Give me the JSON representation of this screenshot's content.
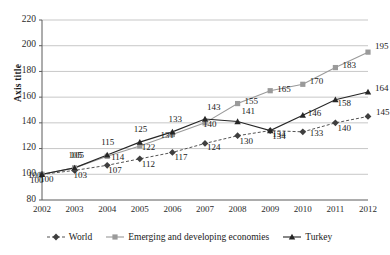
{
  "chart_data": {
    "type": "line",
    "title": "",
    "xlabel": "",
    "ylabel": "Axis title",
    "categories": [
      "2002",
      "2003",
      "2004",
      "2005",
      "2006",
      "2007",
      "2008",
      "2009",
      "2010",
      "2011",
      "2012"
    ],
    "x": [
      2002,
      2003,
      2004,
      2005,
      2006,
      2007,
      2008,
      2009,
      2010,
      2011,
      2012
    ],
    "ylim": [
      80,
      220
    ],
    "ytick_step": 20,
    "yticks": [
      80,
      100,
      120,
      140,
      160,
      180,
      200,
      220
    ],
    "grid": "horizontal",
    "legend_position": "bottom",
    "data_labels": true,
    "series": [
      {
        "name": "World",
        "marker": "diamond",
        "line_style": "dashed",
        "color": "#3f3f3f",
        "values": [
          100,
          103,
          107,
          112,
          117,
          124,
          130,
          134,
          133,
          140,
          145
        ]
      },
      {
        "name": "Emerging and developing economies",
        "marker": "square",
        "line_style": "solid",
        "color": "#9a9a9a",
        "values": [
          100,
          105,
          114,
          122,
          131,
          140,
          155,
          165,
          170,
          183,
          195
        ]
      },
      {
        "name": "Turkey",
        "marker": "triangle",
        "line_style": "solid",
        "color": "#262626",
        "values": [
          100,
          105,
          115,
          125,
          133,
          143,
          141,
          134,
          146,
          158,
          164
        ]
      }
    ]
  },
  "axes": {
    "y_title": "Axis title",
    "y_tick_labels": [
      "220",
      "200",
      "180",
      "160",
      "140",
      "120",
      "100",
      "80"
    ],
    "x_tick_labels": [
      "2002",
      "2003",
      "2004",
      "2005",
      "2006",
      "2007",
      "2008",
      "2009",
      "2010",
      "2011",
      "2012"
    ]
  },
  "legend": {
    "items": [
      {
        "label": "World",
        "marker": "diamond"
      },
      {
        "label": "Emerging and developing economies",
        "marker": "square"
      },
      {
        "label": "Turkey",
        "marker": "triangle"
      }
    ]
  },
  "labels": {
    "world": [
      "100",
      "103",
      "107",
      "112",
      "117",
      "124",
      "130",
      "134",
      "133",
      "140",
      "145"
    ],
    "emerging": [
      "100",
      "105",
      "114",
      "122",
      "131",
      "140",
      "155",
      "165",
      "170",
      "183",
      "195"
    ],
    "turkey": [
      "100",
      "105",
      "115",
      "125",
      "133",
      "143",
      "141",
      "134",
      "146",
      "158",
      "164"
    ]
  },
  "colors": {
    "world": "#3f3f3f",
    "emerging": "#9a9a9a",
    "turkey": "#262626",
    "grid": "#b9b9b9",
    "axis": "#5a5a5a",
    "text": "#1a1a1a"
  }
}
